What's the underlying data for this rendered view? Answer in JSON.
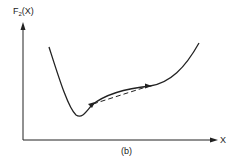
{
  "figure": {
    "y_axis_label_main": "F",
    "y_axis_label_sub": "2",
    "y_axis_label_arg": "(X)",
    "x_axis_label": "X",
    "caption": "(b)",
    "colors": {
      "stroke": "#222222",
      "background": "#ffffff"
    },
    "curve": {
      "description": "Non-convex function with a sharp minimum on the left, rising through a concave segment, then steeply upward on the right",
      "minimum_near": "left",
      "arrow_points": 2,
      "dashed_chord": "Dashed line connecting the two arrowed points below the curve, illustrating non-convexity"
    }
  }
}
